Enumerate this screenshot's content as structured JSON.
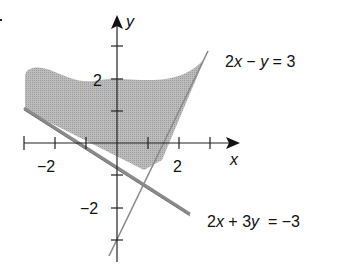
{
  "diagram": {
    "type": "linear inequality system graph",
    "axes": {
      "x_label": "x",
      "y_label": "y",
      "x_ticks": [
        -3,
        -2,
        -1,
        0,
        1,
        2,
        3
      ],
      "y_ticks": [
        -3,
        -2,
        -1,
        0,
        1,
        2,
        3
      ],
      "x_tick_labels": {
        "neg": "−2",
        "pos": "2"
      },
      "y_tick_labels": {
        "pos": "2",
        "neg": "−2"
      }
    },
    "lines": [
      {
        "id": "line1",
        "parts": [
          "2",
          "x",
          " − ",
          "y",
          " = 3"
        ],
        "equation": "2x − y = 3"
      },
      {
        "id": "line2",
        "parts": [
          "2",
          "x",
          " + 3",
          "y",
          "  = −3"
        ],
        "equation": "2x + 3y = −3"
      }
    ],
    "shaded_region": "2x − y < 3 and 2x + 3y > −3",
    "colors": {
      "shade": "#b5b5b5",
      "line": "#8a8a8a",
      "axis": "#222222"
    }
  }
}
